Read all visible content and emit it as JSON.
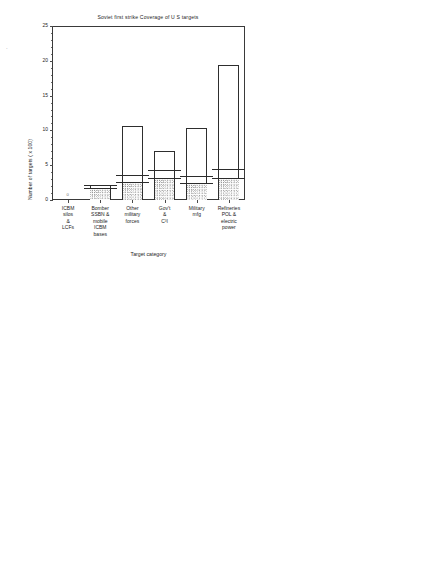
{
  "figure": {
    "panels": [
      {
        "id": "top-left",
        "title": "Soviet first strike  Coverage of U S  targets",
        "ylabel": "Number of targets ( x 100)",
        "xlabel": "Target category",
        "annotations": [
          "Targeted",
          "Destroyed"
        ],
        "zero_marker": "0"
      },
      {
        "id": "top-right",
        "title": "Disposition of forces  Soviet",
        "ylabel": "Number of warheads ( x 1000)",
        "xlabel": "Weapon category"
      },
      {
        "id": "bottom-left",
        "title": "Soviet retaliation/rideout  Coverage of U S  targets",
        "ylabel": "Number of targets ( x 100)",
        "xlabel": "Target category",
        "annotations": [
          "Targeted",
          "Destroyed"
        ],
        "zero_marker": "0"
      },
      {
        "id": "bottom-right",
        "title": "Disposition of forces  Soviet",
        "ylabel": "Number of warheads ( x 1000)",
        "xlabel": "Weapon category"
      }
    ]
  },
  "chart_data": [
    {
      "type": "bar",
      "id": "top-left",
      "title": "Soviet first strike  Coverage of U S  targets",
      "xlabel": "Target category",
      "ylabel": "Number of targets ( x 100)",
      "ylim": [
        0,
        25
      ],
      "yticks": [
        0,
        5,
        10,
        15,
        20,
        25
      ],
      "grid": false,
      "categories": [
        "ICBM\nsilos\n&\nLCFs",
        "Bomber\nSSBN &\nmobile\nICBM\nbases",
        "Other\nmilitary\nforces",
        "Gov't\n&\nC³I",
        "Military\nmfg",
        "Refineries\nPOL &\nelectric\npower"
      ],
      "series": [
        {
          "name": "Total targets",
          "values": [
            0.0,
            2.15,
            10.65,
            7.1,
            10.4,
            19.4
          ]
        },
        {
          "name": "Targeted",
          "values": [
            0.0,
            2.15,
            3.55,
            4.25,
            3.5,
            4.5
          ]
        },
        {
          "name": "Destroyed",
          "values": [
            0.0,
            1.75,
            2.6,
            3.15,
            2.45,
            3.1
          ]
        }
      ]
    },
    {
      "type": "bar",
      "id": "top-right",
      "title": "Disposition of forces  Soviet",
      "xlabel": "Weapon category",
      "ylabel": "Number of warheads ( x 1000)",
      "ylim": [
        0,
        5
      ],
      "yticks": [
        0,
        1,
        2,
        3,
        4,
        5
      ],
      "grid": false,
      "categories": [
        "ICBM",
        "SLBM",
        "Bomber"
      ],
      "totals": [
        2070,
        2816,
        1100
      ],
      "total_labels": [
        "2070",
        "2816",
        "1100"
      ],
      "bars": [
        {
          "category": "ICBM",
          "total": 2.03,
          "segments": [
            {
              "label": "N A",
              "from": 2.03,
              "to": 2.03,
              "stipple": false,
              "show": false
            },
            {
              "label": "S R",
              "from": 1.86,
              "to": 2.03,
              "stipple": false,
              "outside": true
            },
            {
              "label": "Resid",
              "from": 1.09,
              "to": 1.86,
              "stipple": false
            },
            {
              "label": "Used",
              "from": 0.0,
              "to": 1.09,
              "stipple": true
            }
          ]
        },
        {
          "category": "SLBM",
          "total": 2.84,
          "segments": [
            {
              "label": "N A",
              "from": 2.07,
              "to": 2.84,
              "stipple": false
            },
            {
              "label": "S R",
              "from": 1.82,
              "to": 2.07,
              "stipple": false
            },
            {
              "label": "Resid",
              "from": 0.0,
              "to": 1.82,
              "stipple": false
            }
          ]
        },
        {
          "category": "Bomber",
          "total": 1.14,
          "segments": [
            {
              "label": "N A",
              "from": 1.07,
              "to": 1.14,
              "stipple": false,
              "outside": true
            },
            {
              "label": "S R",
              "from": 0.98,
              "to": 1.07,
              "stipple": false,
              "outside": true
            },
            {
              "label": "Resid",
              "from": 0.89,
              "to": 0.98,
              "stipple": false,
              "outside": true
            },
            {
              "label": "Used",
              "from": 0.0,
              "to": 0.89,
              "stipple": true
            }
          ]
        }
      ]
    },
    {
      "type": "bar",
      "id": "bottom-left",
      "title": "Soviet retaliation/rideout  Coverage of U S  targets",
      "xlabel": "Target category",
      "ylabel": "Number of targets ( x 100)",
      "ylim": [
        0,
        25
      ],
      "yticks": [
        0,
        5,
        10,
        15,
        20,
        25
      ],
      "grid": false,
      "categories": [
        "ICBM\nsilos\n&\nLCFs",
        "Bomber\nSSBN &\nmobile\nICBM\nbases",
        "Other\nmilitary\nforces",
        "Gov't\n&\nC³I",
        "Military\nmfg",
        "Refineries\nPOL &\nelectric\npower"
      ],
      "series": [
        {
          "name": "Total targets",
          "values": [
            0.0,
            1.6,
            10.6,
            7.0,
            10.3,
            19.5
          ]
        },
        {
          "name": "Targeted",
          "values": [
            0.0,
            1.6,
            3.6,
            4.3,
            3.5,
            3.6
          ]
        },
        {
          "name": "Destroyed",
          "values": [
            0.0,
            1.25,
            2.5,
            3.2,
            2.5,
            2.6
          ]
        }
      ]
    },
    {
      "type": "bar",
      "id": "bottom-right",
      "title": "Disposition of forces  Soviet",
      "xlabel": "Weapon category",
      "ylabel": "Number of warheads ( x 1000)",
      "ylim": [
        0,
        5
      ],
      "yticks": [
        0,
        1,
        2,
        3,
        4,
        5
      ],
      "grid": false,
      "categories": [
        "ICBM",
        "SLBM",
        "Bomber"
      ],
      "totals": [
        2070,
        2816,
        1100
      ],
      "total_labels": [
        "2070",
        "2816",
        "1100"
      ],
      "bars": [
        {
          "category": "ICBM",
          "total": 2.07,
          "segments": [
            {
              "label": "N A",
              "from": 0.86,
              "to": 2.07,
              "stipple": false
            },
            {
              "label": "Used",
              "from": 0.0,
              "to": 0.86,
              "stipple": true
            }
          ]
        },
        {
          "category": "SLBM",
          "total": 2.82,
          "segments": [
            {
              "label": "N A",
              "from": 0.92,
              "to": 2.82,
              "stipple": false
            },
            {
              "label": "Used",
              "from": 0.0,
              "to": 0.92,
              "stipple": true
            }
          ]
        },
        {
          "category": "Bomber",
          "total": 1.1,
          "segments": [
            {
              "label": "N A",
              "from": 0.17,
              "to": 1.1,
              "stipple": false
            },
            {
              "label": "Used",
              "from": 0.0,
              "to": 0.17,
              "stipple": true
            }
          ]
        }
      ]
    }
  ],
  "labels": {
    "targeted": "Targeted",
    "destroyed": "Destroyed",
    "zero": "0",
    "na": "N A",
    "sr": "S R",
    "resid": "Resid",
    "used": "Used"
  },
  "colors": {
    "axis": "#3a3a3a",
    "bar_outline": "#2e2e2e",
    "text": "#1c1c1c",
    "background": "#ffffff",
    "stipple": "#9a9a9a"
  }
}
